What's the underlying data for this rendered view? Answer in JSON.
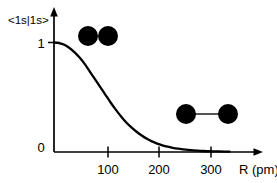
{
  "chart_data": {
    "type": "line",
    "title": "",
    "subtitle": "",
    "xlabel": "R  (pm)",
    "ylabel": "<1s|1s>",
    "xlim": [
      0,
      340
    ],
    "ylim": [
      0,
      1.08
    ],
    "grid": false,
    "legend": null,
    "xticks": [
      100,
      200,
      300
    ],
    "xtick_labels": [
      "100",
      "200",
      "300"
    ],
    "yticks": [
      0,
      1
    ],
    "ytick_labels": [
      "0",
      "1"
    ],
    "series": [
      {
        "name": "overlap-integral",
        "x": [
          0,
          10,
          20,
          30,
          40,
          50,
          60,
          70,
          80,
          90,
          100,
          110,
          120,
          130,
          140,
          150,
          160,
          170,
          180,
          190,
          200,
          210,
          220,
          230,
          240,
          250,
          260,
          270,
          280,
          290,
          300,
          310,
          320,
          330,
          340
        ],
        "y": [
          1.0,
          0.995,
          0.98,
          0.95,
          0.91,
          0.86,
          0.8,
          0.73,
          0.66,
          0.59,
          0.52,
          0.45,
          0.385,
          0.325,
          0.27,
          0.225,
          0.185,
          0.15,
          0.12,
          0.097,
          0.077,
          0.061,
          0.048,
          0.038,
          0.03,
          0.024,
          0.019,
          0.015,
          0.012,
          0.009,
          0.007,
          0.006,
          0.005,
          0.004,
          0.003
        ]
      }
    ],
    "annotations": [
      {
        "id": "overlapping-atoms-diagram",
        "label": "two overlapping atoms at small R",
        "type": "molecule",
        "atoms": [
          {
            "cx": 88,
            "cy": 36,
            "r": 10
          },
          {
            "cx": 108,
            "cy": 36,
            "r": 10
          }
        ],
        "bond": false
      },
      {
        "id": "separated-atoms-diagram",
        "label": "two separated atoms joined by a bond at large R",
        "type": "molecule",
        "atoms": [
          {
            "cx": 186,
            "cy": 114,
            "r": 10
          },
          {
            "cx": 228,
            "cy": 114,
            "r": 10
          }
        ],
        "bond": true
      }
    ]
  },
  "axes": {
    "y_title": "<1s|1s>",
    "x_title": "R  (pm)",
    "y_tick_top": "1",
    "y_tick_bottom": "0",
    "x_tick_1": "100",
    "x_tick_2": "200",
    "x_tick_3": "300"
  },
  "colors": {
    "curve": "#000000",
    "axis": "#000000",
    "atom": "#000000",
    "bond": "#555555",
    "background": "#ffffff"
  }
}
